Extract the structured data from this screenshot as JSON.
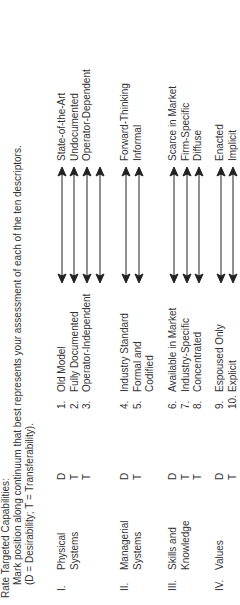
{
  "header": {
    "title": "Rate Targeted Capabilities:",
    "instruction": "Mark position along continuum that best represents your assessment of each of the ten descriptors.",
    "legend": "(D = Desirability; T = Transferability)."
  },
  "groups": [
    {
      "roman": "I.",
      "name_lines": [
        "Physical",
        "Systems"
      ],
      "dt": [
        "D",
        "T",
        "T"
      ],
      "descriptors": [
        {
          "num": "1.",
          "left": "Old Model",
          "right": "State-of-the-Art"
        },
        {
          "num": "2.",
          "left": "Fully Documented",
          "right": "Undocumented"
        },
        {
          "num": "3.",
          "left": "Operator-Independent",
          "right": "Operator-Dependent"
        }
      ],
      "arrow_count": 4
    },
    {
      "roman": "II.",
      "name_lines": [
        "Managerial",
        "Systems"
      ],
      "dt": [
        "D",
        "T"
      ],
      "descriptors": [
        {
          "num": "4.",
          "left": "Industry Standard",
          "right": "Forward-Thinking"
        },
        {
          "num": "5.",
          "left": "Formal and",
          "left2": "Codified",
          "right": "Informal"
        }
      ],
      "arrow_count": 2
    },
    {
      "roman": "III.",
      "name_lines": [
        "Skills and",
        "Knowledge"
      ],
      "dt": [
        "D",
        "T",
        "T"
      ],
      "descriptors": [
        {
          "num": "6.",
          "left": "Available in Market",
          "right": "Scarce in Market"
        },
        {
          "num": "7.",
          "left": "Industry-Specific",
          "right": "Firm-Specific"
        },
        {
          "num": "8.",
          "left": "Concentrated",
          "right": "Diffuse"
        }
      ],
      "arrow_count": 3
    },
    {
      "roman": "IV.",
      "name_lines": [
        "Values"
      ],
      "dt": [
        "D",
        "T"
      ],
      "descriptors": [
        {
          "num": "9.",
          "left": "Espoused Only",
          "right": "Enacted"
        },
        {
          "num": "10.",
          "left": "Explicit",
          "right": "Implicit"
        }
      ],
      "arrow_count": 2
    }
  ],
  "colors": {
    "text": "#333333",
    "arrow": "#222222",
    "background": "#ffffff"
  }
}
